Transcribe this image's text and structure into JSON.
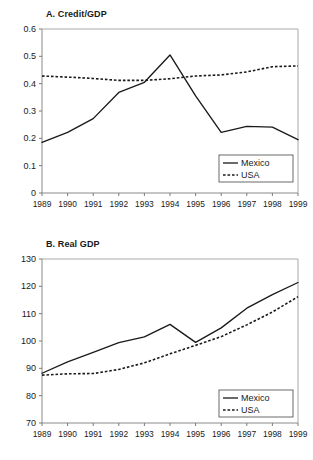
{
  "figure": {
    "width": 313,
    "height": 460,
    "background": "#ffffff",
    "line_color": "#1a1a1a",
    "axis_color": "#8a8a8a"
  },
  "chart_data": [
    {
      "type": "line",
      "panel_id": "A",
      "title": "A. Credit/GDP",
      "xlabel": "",
      "ylabel": "",
      "x": [
        1989,
        1990,
        1991,
        1992,
        1993,
        1994,
        1995,
        1996,
        1997,
        1998,
        1999
      ],
      "categories": [
        "1989",
        "1990",
        "1991",
        "1992",
        "1993",
        "1994",
        "1995",
        "1996",
        "1997",
        "1998",
        "1999"
      ],
      "xlim": [
        1989,
        1999
      ],
      "ylim": [
        0,
        0.6
      ],
      "yticks": [
        0,
        0.1,
        0.2,
        0.3,
        0.4,
        0.5,
        0.6
      ],
      "ytick_labels": [
        "0",
        "0.1",
        "0.2",
        "0.3",
        "0.4",
        "0.5",
        "0.6"
      ],
      "grid": false,
      "legend_position": "lower right",
      "series": [
        {
          "name": "Mexico",
          "style": "solid",
          "values": [
            0.185,
            0.222,
            0.272,
            0.368,
            0.405,
            0.505,
            0.355,
            0.222,
            0.244,
            0.241,
            0.195
          ]
        },
        {
          "name": "USA",
          "style": "dotted",
          "values": [
            0.428,
            0.424,
            0.419,
            0.412,
            0.412,
            0.418,
            0.428,
            0.432,
            0.443,
            0.462,
            0.465
          ]
        }
      ]
    },
    {
      "type": "line",
      "panel_id": "B",
      "title": "B. Real GDP",
      "xlabel": "",
      "ylabel": "",
      "x": [
        1989,
        1990,
        1991,
        1992,
        1993,
        1994,
        1995,
        1996,
        1997,
        1998,
        1999
      ],
      "categories": [
        "1989",
        "1990",
        "1991",
        "1992",
        "1993",
        "1994",
        "1995",
        "1996",
        "1997",
        "1998",
        "1999"
      ],
      "xlim": [
        1989,
        1999
      ],
      "ylim": [
        70,
        130
      ],
      "yticks": [
        70,
        80,
        90,
        100,
        110,
        120,
        130
      ],
      "ytick_labels": [
        "70",
        "80",
        "90",
        "100",
        "110",
        "120",
        "130"
      ],
      "grid": false,
      "legend_position": "lower right",
      "series": [
        {
          "name": "Mexico",
          "style": "solid",
          "values": [
            88.2,
            92.4,
            95.8,
            99.4,
            101.5,
            106.1,
            99.5,
            104.8,
            112.0,
            117.0,
            121.4
          ]
        },
        {
          "name": "USA",
          "style": "dotted",
          "values": [
            87.5,
            88.0,
            88.1,
            89.6,
            92.0,
            95.3,
            98.4,
            101.6,
            105.9,
            110.6,
            116.2
          ]
        }
      ]
    }
  ]
}
